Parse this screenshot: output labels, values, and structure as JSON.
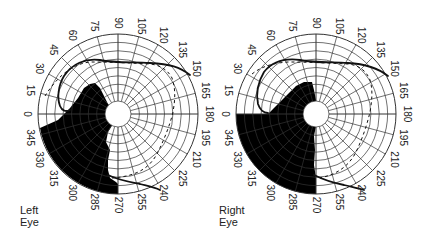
{
  "figure": {
    "type": "visual-field-perimetry",
    "angle_labels": [
      "0",
      "15",
      "30",
      "45",
      "60",
      "75",
      "90",
      "105",
      "120",
      "135",
      "150",
      "165",
      "180",
      "195",
      "210",
      "225",
      "240",
      "255",
      "270",
      "285",
      "300",
      "315",
      "330",
      "345"
    ],
    "colors": {
      "grid": "#333333",
      "scotoma": "#000000",
      "isopter": "#111111",
      "background": "#ffffff"
    }
  },
  "panels": [
    {
      "id": "left",
      "label_line1": "Left",
      "label_line2": "Eye",
      "center": [
        118,
        114
      ],
      "radius": 80,
      "inner_radius": 13,
      "rings": 8,
      "scotoma_path": "M40,128 L58,120 L70,108 L78,98 L84,88 L90,84 L95,83 L100,88 L104,96 L108,104 L112,110 L116,116 L113,124 L108,132 L106,142 L110,150 L108,160 L108,170 L110,178 L116,182 L118,184 L118,194 A80,80 0 0 1 40,128 Z",
      "solid_isopter": [
        "M190,75 C180,67 170,64 150,63 C130,62 115,63 100,60 C85,58 72,64 64,76 C58,86 57,98 60,106 C62,111 66,112 70,110",
        "M108,175 C118,180 130,182 140,184 C148,186 154,187 160,190"
      ],
      "dashed_isopter": "M45,96 C55,80 70,64 90,62 C110,62 130,63 150,64 C160,65 168,70 172,78 C176,90 175,100 173,112 C170,125 164,140 157,154 C150,166 140,176 112,178"
    },
    {
      "id": "right",
      "label_line1": "Right",
      "label_line2": "Eye",
      "center": [
        316,
        114
      ],
      "radius": 80,
      "inner_radius": 13,
      "rings": 8,
      "scotoma_path": "M236,114 L268,114 L274,108 L282,100 L290,92 L296,86 L304,82 L312,82 L314,90 L316,100 L317,110 L314,118 L316,126 L314,136 L315,150 L314,165 L316,178 L316,194 A80,80 0 0 1 236,114 Z",
      "solid_isopter": [
        "M388,76 C378,68 366,64 348,63 C330,62 316,63 300,60 C285,58 272,62 264,72 C258,82 256,94 258,104 C260,110 264,113 268,113",
        "M314,175 C324,180 334,183 344,185 C352,187 358,188 364,190"
      ],
      "dashed_isopter": "M252,74 C262,66 274,63 288,62 C308,62 328,63 348,64 C358,65 366,70 370,80 C373,90 372,100 370,112 C367,125 362,140 355,154 C348,166 338,174 320,178"
    }
  ]
}
